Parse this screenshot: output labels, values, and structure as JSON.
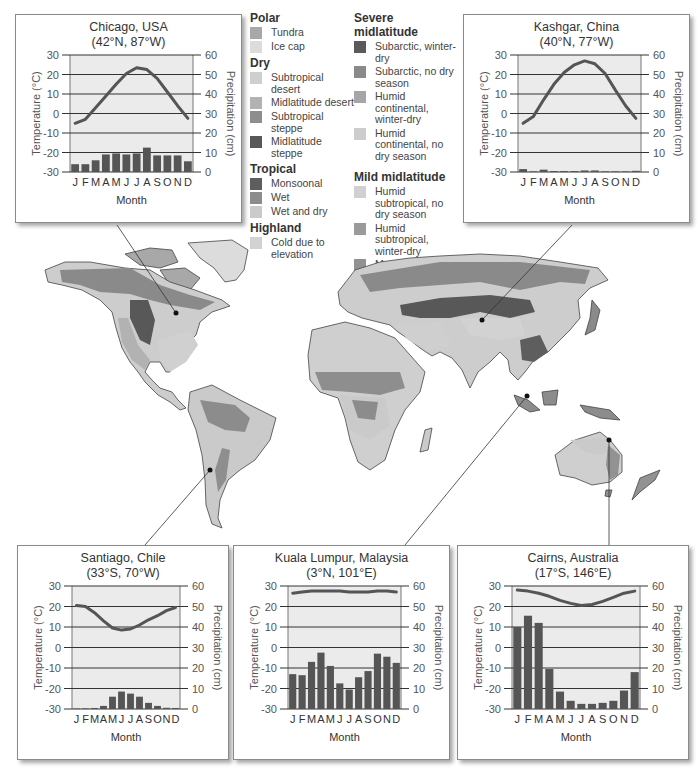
{
  "legend": {
    "groups": [
      {
        "title": "Polar",
        "items": [
          {
            "label": "Tundra",
            "color": "#a8a8a8"
          },
          {
            "label": "Ice cap",
            "color": "#dcdcdc"
          }
        ]
      },
      {
        "title": "Dry",
        "items": [
          {
            "label": "Subtropical desert",
            "color": "#cfcfcf"
          },
          {
            "label": "Midlatitude desert",
            "color": "#b2b2b2"
          },
          {
            "label": "Subtropical steppe",
            "color": "#8e8e8e"
          },
          {
            "label": "Midlatitude steppe",
            "color": "#585858"
          }
        ]
      },
      {
        "title": "Tropical",
        "items": [
          {
            "label": "Monsoonal",
            "color": "#5e5e5e"
          },
          {
            "label": "Wet",
            "color": "#8c8c8c"
          },
          {
            "label": "Wet and dry",
            "color": "#cacaca"
          }
        ]
      },
      {
        "title": "Highland",
        "items": [
          {
            "label": "Cold due to elevation",
            "color": "#d2d2d2"
          }
        ]
      },
      {
        "title": "Severe midlatitude",
        "items": [
          {
            "label": "Subarctic, winter-dry",
            "color": "#5a5a5a"
          },
          {
            "label": "Subarctic, no dry season",
            "color": "#8a8a8a"
          },
          {
            "label": "Humid continental, winter-dry",
            "color": "#a6a6a6"
          },
          {
            "label": "Humid continental, no dry season",
            "color": "#cdcdcd"
          }
        ]
      },
      {
        "title": "Mild midlatitude",
        "items": [
          {
            "label": "Humid subtropical, no dry season",
            "color": "#d0d0d0"
          },
          {
            "label": "Humid subtropical, winter-dry",
            "color": "#9a9a9a"
          },
          {
            "label": "Marine west coast, no dry season",
            "color": "#929292"
          },
          {
            "label": "Mediterranean, summer-dry",
            "color": "#7a7a7a"
          }
        ]
      }
    ]
  },
  "chart_data": [
    {
      "type": "bar+line",
      "title": "Chicago, USA",
      "subtitle": "(42°N, 87°W)",
      "xlabel": "Month",
      "ylabel_left": "Temperature (°C)",
      "ylabel_right": "Precipitation (cm)",
      "ylim_left": [
        -30,
        30
      ],
      "ylim_right": [
        0,
        60
      ],
      "left_ticks": [
        "30",
        "20",
        "10",
        "0",
        "-10",
        "-20",
        "-30"
      ],
      "right_ticks": [
        "60",
        "50",
        "40",
        "30",
        "20",
        "10",
        "0"
      ],
      "categories": [
        "J",
        "F",
        "M",
        "A",
        "M",
        "J",
        "J",
        "A",
        "S",
        "O",
        "N",
        "D"
      ],
      "series": [
        {
          "name": "Temperature (°C)",
          "type": "line",
          "values": [
            -5,
            -3,
            3,
            9,
            15,
            20.5,
            23.5,
            22.5,
            18,
            11,
            4,
            -2.5
          ]
        },
        {
          "name": "Precipitation (cm)",
          "type": "bar",
          "values": [
            4,
            4,
            6,
            9,
            9.5,
            9,
            9.5,
            12.5,
            8.5,
            8.5,
            8.5,
            5.5
          ]
        }
      ]
    },
    {
      "type": "bar+line",
      "title": "Kashgar, China",
      "subtitle": "(40°N, 77°W)",
      "xlabel": "Month",
      "ylabel_left": "Temperature (°C)",
      "ylabel_right": "Precipitation (cm)",
      "ylim_left": [
        -30,
        30
      ],
      "ylim_right": [
        0,
        60
      ],
      "left_ticks": [
        "30",
        "20",
        "10",
        "0",
        "-10",
        "-20",
        "-30"
      ],
      "right_ticks": [
        "60",
        "50",
        "40",
        "30",
        "20",
        "10",
        "0"
      ],
      "categories": [
        "J",
        "F",
        "M",
        "A",
        "M",
        "J",
        "J",
        "A",
        "S",
        "O",
        "N",
        "D"
      ],
      "series": [
        {
          "name": "Temperature (°C)",
          "type": "line",
          "values": [
            -5,
            -1.5,
            7,
            15,
            21,
            25,
            27,
            25.5,
            20.5,
            12,
            4,
            -2.5
          ]
        },
        {
          "name": "Precipitation (cm)",
          "type": "bar",
          "values": [
            1.5,
            0.3,
            1.2,
            0.5,
            0.5,
            0.5,
            0.8,
            0.8,
            0.3,
            0.3,
            0.3,
            0.6
          ]
        }
      ]
    },
    {
      "type": "bar+line",
      "title": "Santiago, Chile",
      "subtitle": "(33°S, 70°W)",
      "xlabel": "Month",
      "ylabel_left": "Temperature (°C)",
      "ylabel_right": "Precipitation (cm)",
      "ylim_left": [
        -30,
        30
      ],
      "ylim_right": [
        0,
        60
      ],
      "left_ticks": [
        "30",
        "20",
        "10",
        "0",
        "-10",
        "-20",
        "-30"
      ],
      "right_ticks": [
        "60",
        "50",
        "40",
        "30",
        "20",
        "10",
        "0"
      ],
      "categories": [
        "J",
        "F",
        "M",
        "A",
        "M",
        "J",
        "J",
        "A",
        "S",
        "O",
        "N",
        "D"
      ],
      "series": [
        {
          "name": "Temperature (°C)",
          "type": "line",
          "values": [
            20.5,
            20,
            17,
            13,
            9.5,
            8.5,
            9,
            11,
            13.5,
            15.5,
            18,
            19.5
          ]
        },
        {
          "name": "Precipitation (cm)",
          "type": "bar",
          "values": [
            0.2,
            0.3,
            0.5,
            1.5,
            6,
            8.5,
            7.5,
            6,
            3,
            1.5,
            0.6,
            0.5
          ]
        }
      ]
    },
    {
      "type": "bar+line",
      "title": "Kuala Lumpur, Malaysia",
      "subtitle": "(3°N, 101°E)",
      "xlabel": "Month",
      "ylabel_left": "Temperature (°C)",
      "ylabel_right": "Precipitation (cm)",
      "ylim_left": [
        -30,
        30
      ],
      "ylim_right": [
        0,
        60
      ],
      "left_ticks": [
        "30",
        "20",
        "10",
        "0",
        "-10",
        "-20",
        "-30"
      ],
      "right_ticks": [
        "60",
        "50",
        "40",
        "30",
        "20",
        "10",
        "0"
      ],
      "categories": [
        "J",
        "F",
        "M",
        "A",
        "M",
        "J",
        "J",
        "A",
        "S",
        "O",
        "N",
        "D"
      ],
      "series": [
        {
          "name": "Temperature (°C)",
          "type": "line",
          "values": [
            26.5,
            27,
            27.5,
            27.5,
            27.5,
            27.5,
            27,
            27,
            27,
            27.5,
            27.5,
            27
          ]
        },
        {
          "name": "Precipitation (cm)",
          "type": "bar",
          "values": [
            17,
            16.5,
            23,
            27.5,
            21,
            12.5,
            9.5,
            15.5,
            18.5,
            27,
            25.5,
            22.5
          ]
        }
      ]
    },
    {
      "type": "bar+line",
      "title": "Cairns, Australia",
      "subtitle": "(17°S, 146°E)",
      "xlabel": "Month",
      "ylabel_left": "Temperature (°C)",
      "ylabel_right": "Precipitation (cm)",
      "ylim_left": [
        -30,
        30
      ],
      "ylim_right": [
        0,
        60
      ],
      "left_ticks": [
        "30",
        "20",
        "10",
        "0",
        "-10",
        "-20",
        "-30"
      ],
      "right_ticks": [
        "60",
        "50",
        "40",
        "30",
        "20",
        "10",
        "0"
      ],
      "categories": [
        "J",
        "F",
        "M",
        "A",
        "M",
        "J",
        "J",
        "A",
        "S",
        "O",
        "N",
        "D"
      ],
      "series": [
        {
          "name": "Temperature (°C)",
          "type": "line",
          "values": [
            28,
            27.5,
            26.5,
            25,
            23,
            21.5,
            20.5,
            21,
            22.5,
            24.5,
            26.5,
            27.5
          ]
        },
        {
          "name": "Precipitation (cm)",
          "type": "bar",
          "values": [
            40,
            45.5,
            42,
            19.5,
            8.5,
            4,
            2.5,
            2.5,
            3,
            4,
            9,
            18
          ]
        }
      ]
    }
  ]
}
